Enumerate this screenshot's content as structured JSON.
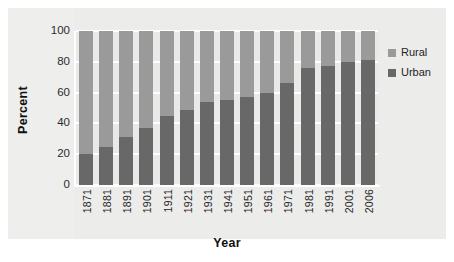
{
  "chart_data": {
    "type": "bar",
    "subtype": "stacked-100-percent",
    "title": "",
    "xlabel": "Year",
    "ylabel": "Percent",
    "ylim": [
      0,
      100
    ],
    "yticks": [
      0,
      20,
      40,
      60,
      80,
      100
    ],
    "grid": true,
    "legend_position": "right",
    "categories": [
      "1871",
      "1881",
      "1891",
      "1901",
      "1911",
      "1921",
      "1931",
      "1941",
      "1951",
      "1961",
      "1971",
      "1981",
      "1991",
      "2001",
      "2006"
    ],
    "series": [
      {
        "name": "Urban",
        "color": "#686868",
        "values": [
          20,
          25,
          31,
          37,
          45,
          49,
          54,
          55,
          57,
          60,
          66,
          76,
          77,
          80,
          81
        ]
      },
      {
        "name": "Rural",
        "color": "#9a9a9a",
        "values": [
          80,
          75,
          69,
          63,
          55,
          51,
          46,
          45,
          43,
          40,
          34,
          24,
          23,
          20,
          19
        ]
      }
    ]
  },
  "legend": {
    "items": [
      {
        "label": "Rural",
        "color": "#9a9a9a"
      },
      {
        "label": "Urban",
        "color": "#686868"
      }
    ]
  },
  "axes": {
    "y_title": "Percent",
    "x_title": "Year",
    "y_tick_labels": [
      "0",
      "20",
      "40",
      "60",
      "80",
      "100"
    ],
    "x_tick_labels": [
      "1871",
      "1881",
      "1891",
      "1901",
      "1911",
      "1921",
      "1931",
      "1941",
      "1951",
      "1961",
      "1971",
      "1981",
      "1991",
      "2001",
      "2006"
    ]
  },
  "colors": {
    "figure_background": "#ffffff",
    "panel_background": "#ececeb",
    "plot_background": "#e9e9e8",
    "gridline": "#ffffff",
    "urban": "#686868",
    "rural": "#9a9a9a",
    "text": "#1f1f1f"
  }
}
